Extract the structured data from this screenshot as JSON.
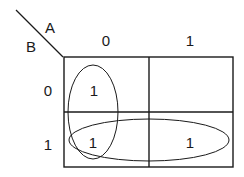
{
  "diagram": {
    "type": "karnaugh-map",
    "variables": {
      "column": "A",
      "row": "B"
    },
    "column_labels": [
      "0",
      "1"
    ],
    "row_labels": [
      "0",
      "1"
    ],
    "cells": [
      [
        "1",
        ""
      ],
      [
        "1",
        "1"
      ]
    ],
    "groups": [
      {
        "name": "column-A0-group",
        "cells": [
          [
            0,
            0
          ],
          [
            1,
            0
          ]
        ]
      },
      {
        "name": "row-B1-group",
        "cells": [
          [
            1,
            0
          ],
          [
            1,
            1
          ]
        ]
      }
    ]
  }
}
